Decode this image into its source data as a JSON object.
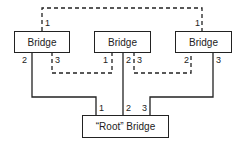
{
  "bridges": [
    {
      "label": "Bridge"
    },
    {
      "label": "Bridge"
    },
    {
      "label": "Bridge"
    }
  ],
  "root": {
    "label": "“Root” Bridge"
  },
  "ports": {
    "left": {
      "top": "1",
      "bottom_left": "2",
      "bottom_right": "3"
    },
    "center": {
      "bottom_left": "1",
      "bottom_mid": "2",
      "bottom_right": "3"
    },
    "right": {
      "top": "1",
      "bottom_left": "2",
      "bottom_right": "3"
    },
    "root": {
      "p1": "1",
      "p2": "2",
      "p3": "3"
    }
  },
  "colors": {
    "line": "#222222"
  }
}
